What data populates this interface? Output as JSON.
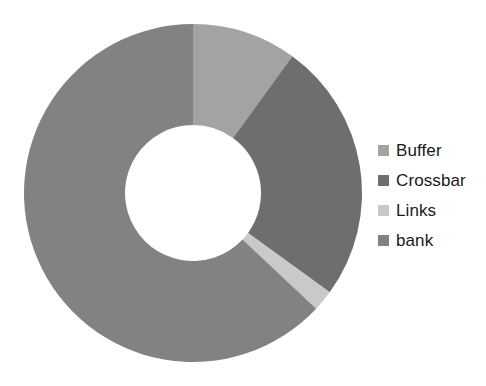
{
  "chart_data": {
    "type": "pie",
    "variant": "donut",
    "title": "",
    "subtitle": "",
    "xlabel": "",
    "ylabel": "",
    "grid": false,
    "legend_position": "right",
    "start_angle_deg": 0,
    "direction": "clockwise",
    "center": {
      "x": 193,
      "y": 193
    },
    "outer_radius": 169,
    "inner_radius": 68,
    "categories": [
      "Buffer",
      "Crossbar",
      "Links",
      "bank"
    ],
    "values": [
      10,
      25,
      2,
      63
    ],
    "units": "percent",
    "colors": [
      "#a3a3a3",
      "#6e6e6e",
      "#c9c9c9",
      "#828282"
    ],
    "slices": [
      {
        "label": "Buffer",
        "value": 10,
        "color": "#a3a3a3",
        "start_deg": 0,
        "end_deg": 36
      },
      {
        "label": "Crossbar",
        "value": 25,
        "color": "#6e6e6e",
        "start_deg": 36,
        "end_deg": 126
      },
      {
        "label": "Links",
        "value": 2,
        "color": "#c9c9c9",
        "start_deg": 126,
        "end_deg": 133.2
      },
      {
        "label": "bank",
        "value": 63,
        "color": "#828282",
        "start_deg": 133.2,
        "end_deg": 360
      }
    ]
  },
  "legend": {
    "items": [
      {
        "label": "Buffer",
        "color": "#a3a3a3",
        "swatch_name": "legend-swatch-buffer"
      },
      {
        "label": "Crossbar",
        "color": "#6e6e6e",
        "swatch_name": "legend-swatch-crossbar"
      },
      {
        "label": "Links",
        "color": "#c9c9c9",
        "swatch_name": "legend-swatch-links"
      },
      {
        "label": "bank",
        "color": "#828282",
        "swatch_name": "legend-swatch-bank"
      }
    ]
  },
  "canvas": {
    "background": "#ffffff",
    "width": 486,
    "height": 386
  }
}
